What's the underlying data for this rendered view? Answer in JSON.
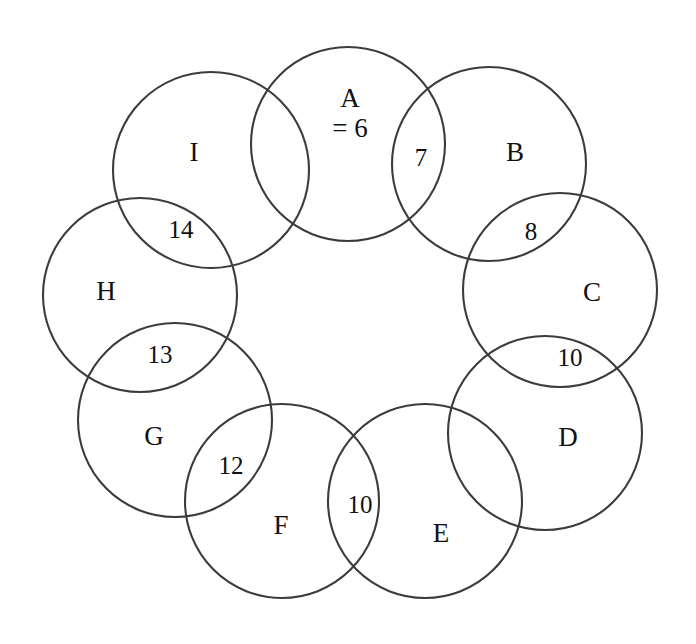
{
  "figure": {
    "kind": "ring-venn-diagram",
    "background_color": "#ffffff",
    "stroke_color": "#3c3c3c",
    "text_color": "#111111",
    "circle_count": 9
  },
  "sets": [
    {
      "id": "A",
      "label": "A",
      "value_label": "= 6",
      "cx": 348,
      "cy": 144,
      "r": 97
    },
    {
      "id": "B",
      "label": "B",
      "value_label": "",
      "cx": 489,
      "cy": 164,
      "r": 97
    },
    {
      "id": "C",
      "label": "C",
      "value_label": "",
      "cx": 560,
      "cy": 290,
      "r": 97
    },
    {
      "id": "D",
      "label": "D",
      "value_label": "",
      "cx": 545,
      "cy": 433,
      "r": 97
    },
    {
      "id": "E",
      "label": "E",
      "value_label": "",
      "cx": 425,
      "cy": 501,
      "r": 97
    },
    {
      "id": "F",
      "label": "F",
      "value_label": "",
      "cx": 282,
      "cy": 501,
      "r": 97
    },
    {
      "id": "G",
      "label": "G",
      "value_label": "",
      "cx": 175,
      "cy": 420,
      "r": 97
    },
    {
      "id": "H",
      "label": "H",
      "value_label": "",
      "cx": 140,
      "cy": 295,
      "r": 97
    },
    {
      "id": "I",
      "label": "I",
      "value_label": "",
      "cx": 211,
      "cy": 170,
      "r": 98
    }
  ],
  "set_labels": [
    {
      "id": "A",
      "text": "A",
      "sub_text": "= 6",
      "x": 350,
      "y": 113
    },
    {
      "id": "B",
      "text": "B",
      "sub_text": "",
      "x": 515,
      "y": 152
    },
    {
      "id": "C",
      "text": "C",
      "sub_text": "",
      "x": 592,
      "y": 292
    },
    {
      "id": "D",
      "text": "D",
      "sub_text": "",
      "x": 568,
      "y": 437
    },
    {
      "id": "E",
      "text": "E",
      "sub_text": "",
      "x": 441,
      "y": 533
    },
    {
      "id": "F",
      "text": "F",
      "sub_text": "",
      "x": 281,
      "y": 525
    },
    {
      "id": "G",
      "text": "G",
      "sub_text": "",
      "x": 154,
      "y": 436
    },
    {
      "id": "H",
      "text": "H",
      "sub_text": "",
      "x": 106,
      "y": 291
    },
    {
      "id": "I",
      "text": "I",
      "sub_text": "",
      "x": 194,
      "y": 152
    }
  ],
  "intersections": [
    {
      "pair": "A-B",
      "value": "7",
      "x": 421,
      "y": 158
    },
    {
      "pair": "B-C",
      "value": "8",
      "x": 531,
      "y": 232
    },
    {
      "pair": "C-D",
      "value": "10",
      "x": 570,
      "y": 358
    },
    {
      "pair": "D-E",
      "value": "",
      "x": 489,
      "y": 469
    },
    {
      "pair": "E-F",
      "value": "10",
      "x": 360,
      "y": 505
    },
    {
      "pair": "F-G",
      "value": "12",
      "x": 231,
      "y": 466
    },
    {
      "pair": "G-H",
      "value": "13",
      "x": 160,
      "y": 355
    },
    {
      "pair": "H-I",
      "value": "14",
      "x": 181,
      "y": 230
    },
    {
      "pair": "I-A",
      "value": "",
      "x": 280,
      "y": 158
    }
  ],
  "chart_data": {
    "type": "diagram",
    "title": "",
    "categories": [
      "A",
      "B",
      "C",
      "D",
      "E",
      "F",
      "G",
      "H",
      "I"
    ],
    "set_value": {
      "A": 6
    },
    "overlap_labels": {
      "A-B": 7,
      "B-C": 8,
      "C-D": 10,
      "E-F": 10,
      "F-G": 12,
      "G-H": 13,
      "H-I": 14
    },
    "empty_overlaps": [
      "D-E",
      "I-A"
    ],
    "legend": "",
    "grid": false
  }
}
